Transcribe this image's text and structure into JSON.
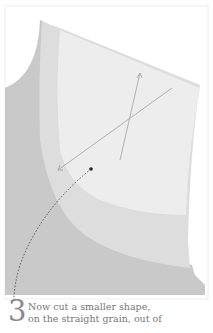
{
  "illustration": {
    "description": "Sewing instruction illustration: fabric layers with grain-line arrows",
    "colors": {
      "background_fabric": "#c9c9c9",
      "middle_layer": "#dcdcdc",
      "top_piece": "#ececec",
      "arrow": "#9a9a9a",
      "leader": "#333333"
    }
  },
  "caption": {
    "step_number": "3",
    "line1": "Now cut a smaller shape,",
    "line2": "on the straight grain, out of"
  }
}
